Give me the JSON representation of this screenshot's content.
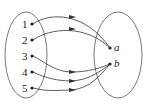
{
  "diagram": {
    "type": "function-mapping",
    "domain": {
      "elements": [
        {
          "label": "1",
          "x": 32,
          "y": 24
        },
        {
          "label": "2",
          "x": 32,
          "y": 40
        },
        {
          "label": "3",
          "x": 32,
          "y": 56
        },
        {
          "label": "4",
          "x": 32,
          "y": 72
        },
        {
          "label": "5",
          "x": 32,
          "y": 88
        }
      ]
    },
    "codomain": {
      "elements": [
        {
          "label": "a",
          "x": 110,
          "y": 48
        },
        {
          "label": "b",
          "x": 110,
          "y": 64
        }
      ]
    },
    "mapping": [
      {
        "from": "1",
        "to": "a"
      },
      {
        "from": "2",
        "to": "a"
      },
      {
        "from": "3",
        "to": "b"
      },
      {
        "from": "4",
        "to": "b"
      },
      {
        "from": "5",
        "to": "b"
      }
    ],
    "colors": {
      "stroke": "#333333",
      "text": "#222222"
    }
  }
}
